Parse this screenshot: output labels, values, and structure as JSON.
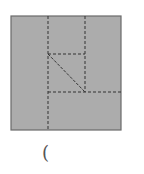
{
  "figure": {
    "fill_color": "#acacac",
    "border_color": "#6a6a6a",
    "line_color": "#333333",
    "square": {
      "x": 11,
      "y": 16,
      "w": 110,
      "h": 114
    },
    "dashed_lines": [
      {
        "x1": 48,
        "y1": 16,
        "x2": 48,
        "y2": 130
      },
      {
        "x1": 85,
        "y1": 16,
        "x2": 85,
        "y2": 92
      },
      {
        "x1": 48,
        "y1": 54,
        "x2": 85,
        "y2": 54
      },
      {
        "x1": 48,
        "y1": 92,
        "x2": 121,
        "y2": 92
      }
    ],
    "diagonal": {
      "x1": 48,
      "y1": 54,
      "x2": 85,
      "y2": 92
    }
  },
  "caption": {
    "text": "("
  }
}
